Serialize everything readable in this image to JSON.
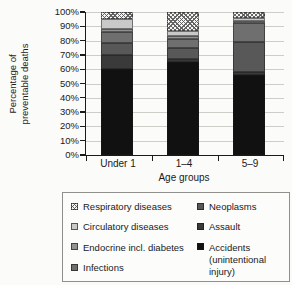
{
  "figure": {
    "background": "#fbfbf9"
  },
  "chart_data": {
    "type": "bar",
    "stacked": true,
    "grid": true,
    "legend_position": "bottom",
    "xlabel": "Age groups",
    "ylabel": "Percentage of preventable deaths",
    "ylabel_lines": [
      "Percentage of",
      "preventable deaths"
    ],
    "categories": [
      "Under 1",
      "1–4",
      "5–9"
    ],
    "y_ticks": [
      "100%",
      "90%",
      "80%",
      "70%",
      "60%",
      "50%",
      "40%",
      "30%",
      "20%",
      "10%",
      "0%"
    ],
    "ylim": [
      0,
      100
    ],
    "series": [
      {
        "name": "Accidents (unintentional injury)",
        "color": "#111111",
        "pattern": "solid",
        "values": [
          60,
          65,
          56
        ]
      },
      {
        "name": "Assault",
        "color": "#3a3a3a",
        "pattern": "solid",
        "values": [
          10,
          2,
          2
        ]
      },
      {
        "name": "Neoplasms",
        "color": "#585858",
        "pattern": "solid",
        "values": [
          8,
          8,
          21
        ]
      },
      {
        "name": "Infections",
        "color": "#6f6f6f",
        "pattern": "solid",
        "values": [
          8,
          6,
          13
        ]
      },
      {
        "name": "Endocrine incl. diabetes",
        "color": "#929292",
        "pattern": "solid",
        "values": [
          2,
          2,
          2
        ]
      },
      {
        "name": "Circulatory diseases",
        "color": "#c9c9c9",
        "pattern": "solid",
        "values": [
          7,
          4,
          2
        ]
      },
      {
        "name": "Respiratory diseases",
        "color": "#f5f5f2",
        "pattern": "crosshatch",
        "values": [
          5,
          13,
          4
        ]
      }
    ]
  },
  "legend": {
    "columns": [
      [
        "Respiratory diseases",
        "Circulatory diseases",
        "Endocrine incl. diabetes",
        "Infections"
      ],
      [
        "Neoplasms",
        "Assault",
        "Accidents (unintentional injury)"
      ]
    ]
  }
}
